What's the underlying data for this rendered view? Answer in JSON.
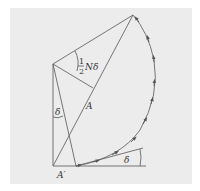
{
  "diagram": {
    "type": "phasor-arc",
    "labels": {
      "half_numer": "1",
      "half_denom": "2",
      "n_delta": "Nδ",
      "delta_left": "δ",
      "delta_right": "δ",
      "a": "A",
      "a_prime": "A′"
    },
    "colors": {
      "background": "#ececec",
      "line": "#666666",
      "arrow": "#555555"
    },
    "points": {
      "a_prime": [
        53,
        166
      ],
      "center": [
        53,
        64
      ],
      "top": [
        133,
        15
      ],
      "arc_start": [
        76,
        166
      ],
      "foot": [
        93,
        88
      ],
      "tangent_end": [
        143,
        148
      ],
      "baseline_end": [
        146,
        166
      ]
    }
  }
}
